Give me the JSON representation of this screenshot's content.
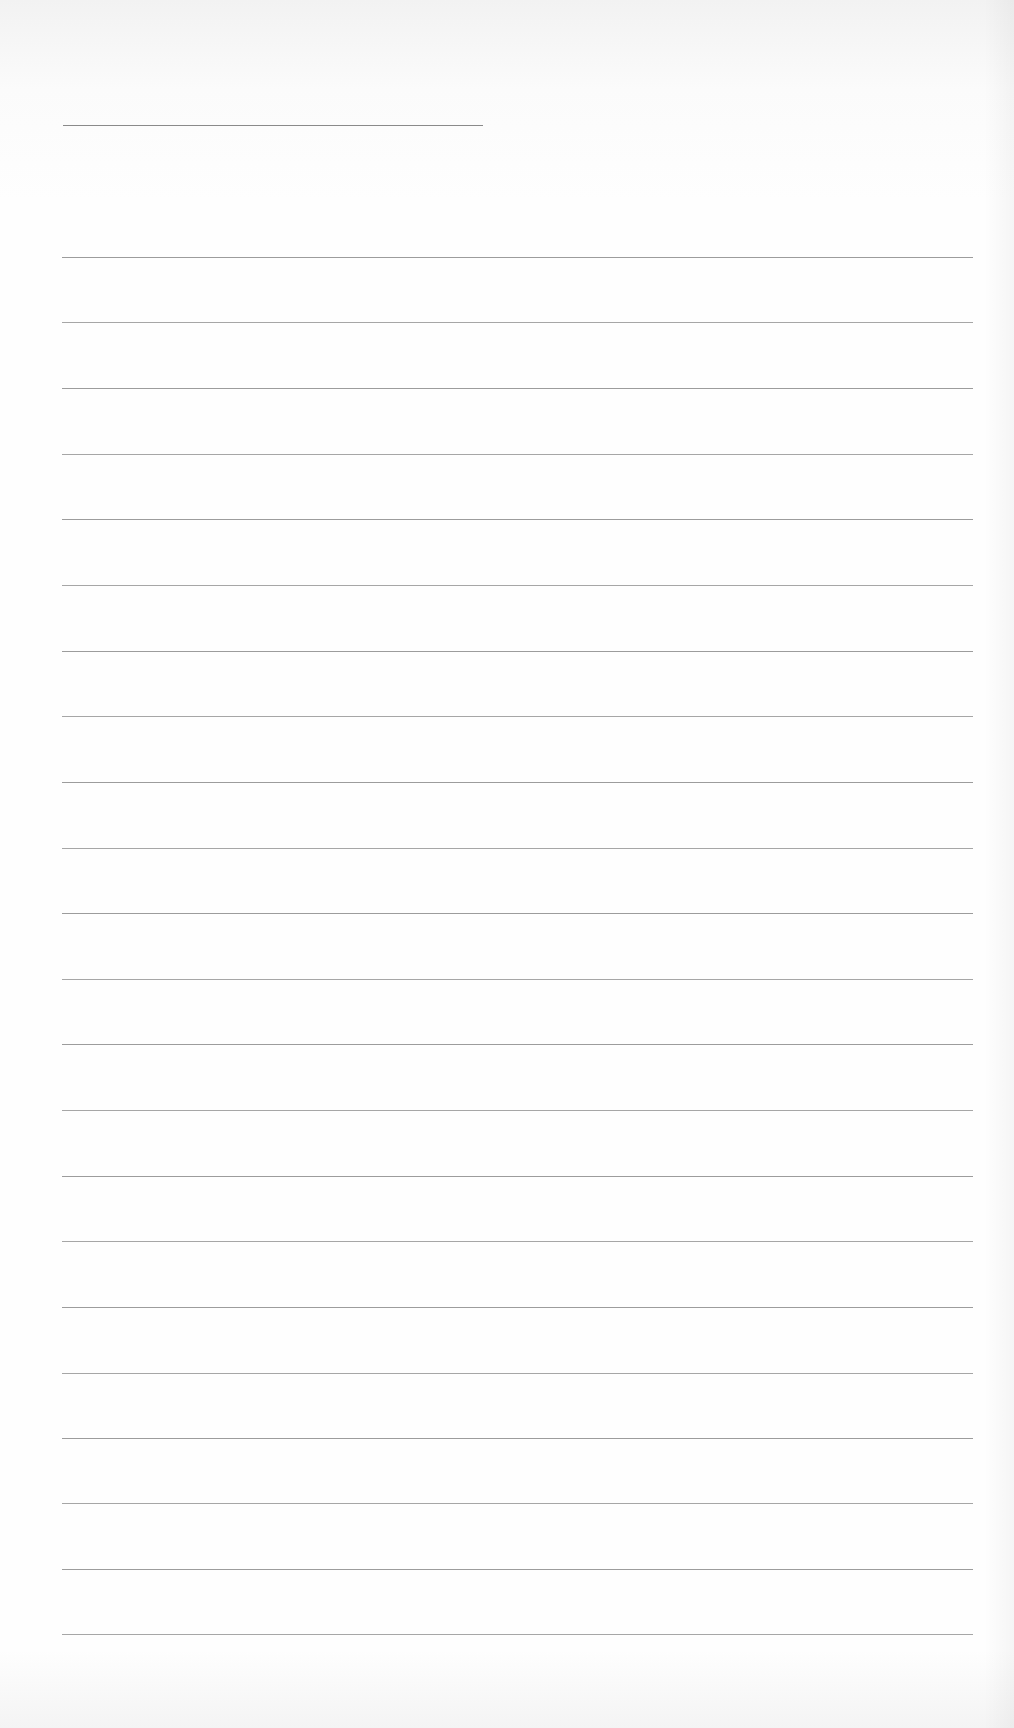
{
  "page": {
    "type": "lined-paper",
    "background_color": "#fdfdfd",
    "line_color": "#9c9c9c",
    "title_line": {
      "left": 63,
      "top": 125,
      "width": 420
    },
    "ruled_lines": {
      "left": 62,
      "width": 911,
      "count": 22,
      "positions": [
        257,
        322,
        388,
        454,
        519,
        585,
        651,
        716,
        782,
        848,
        913,
        979,
        1044,
        1110,
        1176,
        1241,
        1307,
        1373,
        1438,
        1503,
        1569,
        1634
      ]
    }
  }
}
